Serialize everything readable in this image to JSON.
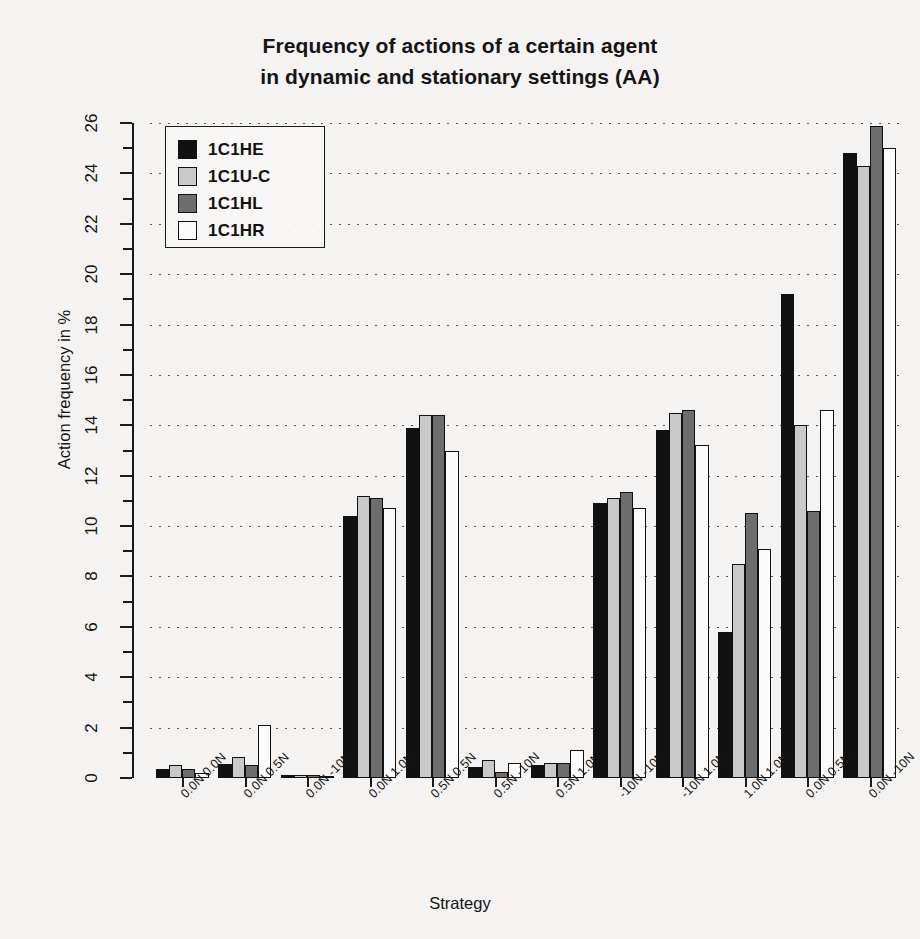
{
  "chart_data": {
    "type": "bar",
    "title": "Frequency of actions of a certain agent in dynamic and stationary settings (AA)",
    "title_line1": "Frequency of actions of a certain agent",
    "title_line2": "in dynamic and stationary settings (AA)",
    "xlabel": "Strategy",
    "ylabel": "Action frequency in %",
    "ylim": [
      0,
      26
    ],
    "ytick_labels": [
      "0",
      "2",
      "4",
      "6",
      "8",
      "10",
      "12",
      "14",
      "16",
      "18",
      "20",
      "22",
      "24",
      "26"
    ],
    "ytick_values": [
      0,
      2,
      4,
      6,
      8,
      10,
      12,
      14,
      16,
      18,
      20,
      22,
      24,
      26
    ],
    "grid": "horizontal-dotted",
    "legend_position": "top-left",
    "categories": [
      "0.0N 0.0N",
      "0.0N 0.5N",
      "0.0N -10N",
      "0.0N 1.0N",
      "0.5N 0.5N",
      "0.5N -10N",
      "0.5N 1.0N",
      "-10N -10N",
      "-10N 1.0N",
      "1.0N 1.0N",
      "0.0N 0.5N",
      "0.0N -10N"
    ],
    "series": [
      {
        "name": "1C1HE",
        "color": "#111111",
        "values": [
          0.35,
          0.55,
          0.1,
          10.4,
          13.9,
          0.45,
          0.5,
          10.9,
          13.8,
          5.8,
          19.2,
          24.8
        ]
      },
      {
        "name": "1C1U-C",
        "color": "#c9c9c9",
        "values": [
          0.5,
          0.85,
          0.1,
          11.2,
          14.4,
          0.7,
          0.6,
          11.1,
          14.5,
          8.5,
          14.0,
          24.3
        ]
      },
      {
        "name": "1C1HL",
        "color": "#6d6d6d",
        "values": [
          0.35,
          0.5,
          0.1,
          11.1,
          14.4,
          0.25,
          0.6,
          11.35,
          14.6,
          10.5,
          10.6,
          25.9
        ]
      },
      {
        "name": "1C1HR",
        "color": "#fbfbfb",
        "values": [
          0.2,
          2.1,
          0.05,
          10.7,
          13.0,
          0.6,
          1.1,
          10.7,
          13.2,
          9.1,
          14.6,
          25.0
        ]
      }
    ]
  },
  "legend": {
    "entries": [
      {
        "label": "1C1HE",
        "color": "#111111"
      },
      {
        "label": "1C1U-C",
        "color": "#c9c9c9"
      },
      {
        "label": "1C1HL",
        "color": "#6d6d6d"
      },
      {
        "label": "1C1HR",
        "color": "#fbfbfb"
      }
    ]
  }
}
